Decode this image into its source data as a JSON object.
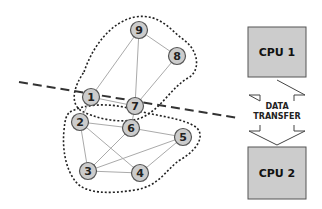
{
  "diagram": {
    "colors": {
      "node_fill": "#cccccc",
      "node_stroke": "#555555",
      "edge": "#aaaaaa",
      "cluster_outline": "#222222",
      "partition_line": "#333333",
      "cpu_fill": "#cccccc",
      "cpu_stroke": "#555555"
    },
    "nodes": [
      {
        "id": "1",
        "x": 91,
        "y": 97
      },
      {
        "id": "2",
        "x": 80,
        "y": 122
      },
      {
        "id": "3",
        "x": 88,
        "y": 171
      },
      {
        "id": "4",
        "x": 140,
        "y": 173
      },
      {
        "id": "5",
        "x": 183,
        "y": 137
      },
      {
        "id": "6",
        "x": 131,
        "y": 128
      },
      {
        "id": "7",
        "x": 135,
        "y": 106
      },
      {
        "id": "8",
        "x": 177,
        "y": 56
      },
      {
        "id": "9",
        "x": 139,
        "y": 30
      }
    ],
    "edges": [
      [
        "9",
        "1"
      ],
      [
        "9",
        "7"
      ],
      [
        "9",
        "8"
      ],
      [
        "1",
        "7"
      ],
      [
        "7",
        "8"
      ],
      [
        "2",
        "6"
      ],
      [
        "2",
        "3"
      ],
      [
        "2",
        "4"
      ],
      [
        "6",
        "5"
      ],
      [
        "6",
        "3"
      ],
      [
        "3",
        "5"
      ],
      [
        "3",
        "4"
      ],
      [
        "4",
        "5"
      ],
      [
        "1",
        "2"
      ],
      [
        "7",
        "6"
      ]
    ],
    "clusters": [
      {
        "name": "partition-1",
        "members": [
          "1",
          "7",
          "8",
          "9"
        ]
      },
      {
        "name": "partition-2",
        "members": [
          "2",
          "3",
          "4",
          "5",
          "6"
        ]
      }
    ],
    "cpus": [
      {
        "label": "CPU 1",
        "x": 248,
        "y": 27,
        "w": 58,
        "h": 50
      },
      {
        "label": "CPU 2",
        "x": 248,
        "y": 147,
        "w": 58,
        "h": 52
      }
    ],
    "transfer": {
      "line1": "DATA",
      "line2": "TRANSFER"
    }
  }
}
